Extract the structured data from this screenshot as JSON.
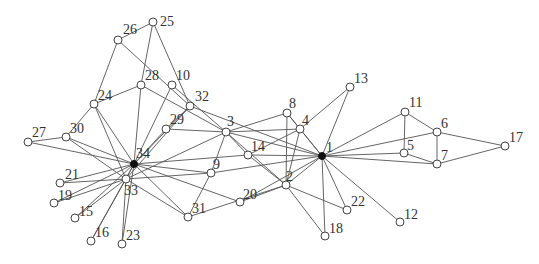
{
  "graph": {
    "title": "",
    "colors": {
      "edge": "#555555",
      "node_fill": "#ffffff",
      "node_stroke": "#444444",
      "hub_fill": "#111111"
    },
    "nodes": [
      {
        "id": "1",
        "x": 322,
        "y": 156,
        "hub": true,
        "lx": 4,
        "ly": -4
      },
      {
        "id": "2",
        "x": 286,
        "y": 185,
        "hub": false,
        "lx": 0,
        "ly": -4
      },
      {
        "id": "3",
        "x": 226,
        "y": 132,
        "hub": false,
        "lx": 1,
        "ly": -6
      },
      {
        "id": "4",
        "x": 300,
        "y": 129,
        "hub": false,
        "lx": 2,
        "ly": -4
      },
      {
        "id": "5",
        "x": 404,
        "y": 153,
        "hub": false,
        "lx": 3,
        "ly": -3
      },
      {
        "id": "6",
        "x": 437,
        "y": 132,
        "hub": false,
        "lx": 4,
        "ly": -4
      },
      {
        "id": "7",
        "x": 437,
        "y": 164,
        "hub": false,
        "lx": 4,
        "ly": -4
      },
      {
        "id": "8",
        "x": 287,
        "y": 113,
        "hub": false,
        "lx": 2,
        "ly": -5
      },
      {
        "id": "9",
        "x": 211,
        "y": 173,
        "hub": false,
        "lx": 2,
        "ly": -4
      },
      {
        "id": "10",
        "x": 172,
        "y": 85,
        "hub": false,
        "lx": 4,
        "ly": -5
      },
      {
        "id": "11",
        "x": 405,
        "y": 112,
        "hub": false,
        "lx": 4,
        "ly": -5
      },
      {
        "id": "12",
        "x": 400,
        "y": 222,
        "hub": false,
        "lx": 4,
        "ly": -3
      },
      {
        "id": "13",
        "x": 350,
        "y": 87,
        "hub": false,
        "lx": 4,
        "ly": -4
      },
      {
        "id": "14",
        "x": 248,
        "y": 155,
        "hub": false,
        "lx": 3,
        "ly": -4
      },
      {
        "id": "15",
        "x": 75,
        "y": 218,
        "hub": false,
        "lx": 4,
        "ly": -2
      },
      {
        "id": "16",
        "x": 91,
        "y": 241,
        "hub": false,
        "lx": 4,
        "ly": -4
      },
      {
        "id": "17",
        "x": 505,
        "y": 146,
        "hub": false,
        "lx": 4,
        "ly": -4
      },
      {
        "id": "18",
        "x": 325,
        "y": 236,
        "hub": false,
        "lx": 4,
        "ly": -3
      },
      {
        "id": "19",
        "x": 54,
        "y": 203,
        "hub": false,
        "lx": 4,
        "ly": -3
      },
      {
        "id": "20",
        "x": 240,
        "y": 202,
        "hub": false,
        "lx": 3,
        "ly": -3
      },
      {
        "id": "21",
        "x": 60,
        "y": 183,
        "hub": false,
        "lx": 5,
        "ly": -4
      },
      {
        "id": "22",
        "x": 347,
        "y": 210,
        "hub": false,
        "lx": 4,
        "ly": -4
      },
      {
        "id": "23",
        "x": 122,
        "y": 244,
        "hub": false,
        "lx": 4,
        "ly": -4
      },
      {
        "id": "24",
        "x": 94,
        "y": 104,
        "hub": false,
        "lx": 4,
        "ly": -4
      },
      {
        "id": "25",
        "x": 153,
        "y": 22,
        "hub": false,
        "lx": 7,
        "ly": 4
      },
      {
        "id": "26",
        "x": 118,
        "y": 40,
        "hub": false,
        "lx": 5,
        "ly": -6
      },
      {
        "id": "27",
        "x": 28,
        "y": 142,
        "hub": false,
        "lx": 4,
        "ly": -5
      },
      {
        "id": "28",
        "x": 141,
        "y": 85,
        "hub": false,
        "lx": 4,
        "ly": -5
      },
      {
        "id": "29",
        "x": 166,
        "y": 129,
        "hub": false,
        "lx": 4,
        "ly": -5
      },
      {
        "id": "30",
        "x": 66,
        "y": 137,
        "hub": false,
        "lx": 4,
        "ly": -4
      },
      {
        "id": "31",
        "x": 188,
        "y": 217,
        "hub": false,
        "lx": 4,
        "ly": -4
      },
      {
        "id": "32",
        "x": 190,
        "y": 106,
        "hub": false,
        "lx": 5,
        "ly": -5
      },
      {
        "id": "33",
        "x": 126,
        "y": 179,
        "hub": false,
        "lx": -2,
        "ly": 16
      },
      {
        "id": "34",
        "x": 134,
        "y": 164,
        "hub": true,
        "lx": 2,
        "ly": -6
      }
    ],
    "edges": [
      [
        "1",
        "2"
      ],
      [
        "1",
        "3"
      ],
      [
        "1",
        "4"
      ],
      [
        "1",
        "5"
      ],
      [
        "1",
        "6"
      ],
      [
        "1",
        "7"
      ],
      [
        "1",
        "8"
      ],
      [
        "1",
        "9"
      ],
      [
        "1",
        "11"
      ],
      [
        "1",
        "12"
      ],
      [
        "1",
        "13"
      ],
      [
        "1",
        "14"
      ],
      [
        "1",
        "18"
      ],
      [
        "1",
        "20"
      ],
      [
        "1",
        "22"
      ],
      [
        "1",
        "32"
      ],
      [
        "2",
        "3"
      ],
      [
        "2",
        "4"
      ],
      [
        "2",
        "8"
      ],
      [
        "2",
        "14"
      ],
      [
        "2",
        "18"
      ],
      [
        "2",
        "20"
      ],
      [
        "2",
        "22"
      ],
      [
        "2",
        "31"
      ],
      [
        "3",
        "4"
      ],
      [
        "3",
        "8"
      ],
      [
        "3",
        "9"
      ],
      [
        "3",
        "10"
      ],
      [
        "3",
        "14"
      ],
      [
        "3",
        "28"
      ],
      [
        "3",
        "29"
      ],
      [
        "3",
        "33"
      ],
      [
        "4",
        "8"
      ],
      [
        "4",
        "13"
      ],
      [
        "4",
        "14"
      ],
      [
        "5",
        "7"
      ],
      [
        "5",
        "11"
      ],
      [
        "6",
        "7"
      ],
      [
        "6",
        "11"
      ],
      [
        "6",
        "17"
      ],
      [
        "7",
        "17"
      ],
      [
        "9",
        "31"
      ],
      [
        "9",
        "33"
      ],
      [
        "9",
        "34"
      ],
      [
        "10",
        "34"
      ],
      [
        "14",
        "34"
      ],
      [
        "15",
        "33"
      ],
      [
        "15",
        "34"
      ],
      [
        "16",
        "33"
      ],
      [
        "16",
        "34"
      ],
      [
        "19",
        "33"
      ],
      [
        "19",
        "34"
      ],
      [
        "20",
        "34"
      ],
      [
        "21",
        "33"
      ],
      [
        "21",
        "34"
      ],
      [
        "23",
        "33"
      ],
      [
        "23",
        "34"
      ],
      [
        "24",
        "26"
      ],
      [
        "24",
        "28"
      ],
      [
        "24",
        "30"
      ],
      [
        "24",
        "33"
      ],
      [
        "24",
        "34"
      ],
      [
        "25",
        "26"
      ],
      [
        "25",
        "28"
      ],
      [
        "25",
        "32"
      ],
      [
        "26",
        "32"
      ],
      [
        "27",
        "30"
      ],
      [
        "27",
        "34"
      ],
      [
        "28",
        "34"
      ],
      [
        "29",
        "32"
      ],
      [
        "29",
        "34"
      ],
      [
        "30",
        "33"
      ],
      [
        "30",
        "34"
      ],
      [
        "31",
        "33"
      ],
      [
        "31",
        "34"
      ],
      [
        "32",
        "33"
      ],
      [
        "32",
        "34"
      ],
      [
        "33",
        "34"
      ]
    ]
  }
}
